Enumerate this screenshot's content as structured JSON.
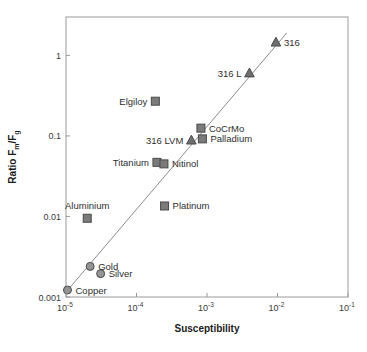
{
  "chart_data": {
    "type": "scatter",
    "title": "",
    "xlabel": "Susceptibility",
    "ylabel": "Ratio Fm/Fg",
    "ylabel_parts": {
      "prefix": "Ratio F",
      "sub1": "m",
      "mid": "/F",
      "sub2": "g"
    },
    "xscale": "log",
    "yscale": "log",
    "xlim": [
      1e-05,
      0.1
    ],
    "ylim": [
      0.001,
      3
    ],
    "grid": false,
    "legend": "none",
    "xticks": [
      {
        "value": 1e-05,
        "label": "10",
        "exponent": "-5"
      },
      {
        "value": 0.0001,
        "label": "10",
        "exponent": "-4"
      },
      {
        "value": 0.001,
        "label": "10",
        "exponent": "-3"
      },
      {
        "value": 0.01,
        "label": "10",
        "exponent": "-2"
      },
      {
        "value": 0.1,
        "label": "10",
        "exponent": "-1"
      }
    ],
    "yticks": [
      {
        "value": 1,
        "label": "1"
      },
      {
        "value": 0.1,
        "label": "0.1"
      },
      {
        "value": 0.01,
        "label": "0.01"
      },
      {
        "value": 0.001,
        "label": "0.001"
      }
    ],
    "trendline": {
      "x": [
        1e-05,
        0.0135
      ],
      "y": [
        0.00115,
        1.9
      ],
      "color": "#8c8c8c"
    },
    "marker_colors": {
      "square": "#7b7b7b",
      "circle": "#949494",
      "triangle": "#6e6e6e",
      "edge": "#4a4a4a"
    },
    "points": [
      {
        "name": "316",
        "x": 0.0095,
        "y": 1.45,
        "marker": "triangle",
        "label": "316",
        "label_pos": "right"
      },
      {
        "name": "316 L",
        "x": 0.004,
        "y": 0.6,
        "marker": "triangle",
        "label": "316 L",
        "label_pos": "left"
      },
      {
        "name": "Elgiloy",
        "x": 0.000185,
        "y": 0.27,
        "marker": "square",
        "label": "Elgiloy",
        "label_pos": "left"
      },
      {
        "name": "CoCrMo",
        "x": 0.00082,
        "y": 0.125,
        "marker": "square",
        "label": "CoCrMo",
        "label_pos": "right"
      },
      {
        "name": "Palladium",
        "x": 0.00086,
        "y": 0.092,
        "marker": "square",
        "label": "Palladium",
        "label_pos": "right"
      },
      {
        "name": "316 LVM",
        "x": 0.0006,
        "y": 0.088,
        "marker": "triangle",
        "label": "316 LVM",
        "label_pos": "left"
      },
      {
        "name": "Titanium",
        "x": 0.000195,
        "y": 0.047,
        "marker": "square",
        "label": "Titanium",
        "label_pos": "left"
      },
      {
        "name": "Nitinol",
        "x": 0.000245,
        "y": 0.045,
        "marker": "square",
        "label": "Nitinol",
        "label_pos": "right"
      },
      {
        "name": "Platinum",
        "x": 0.00025,
        "y": 0.0135,
        "marker": "square",
        "label": "Platinum",
        "label_pos": "right"
      },
      {
        "name": "Aluminium",
        "x": 2e-05,
        "y": 0.0095,
        "marker": "square",
        "label": "Aluminium",
        "label_pos": "above"
      },
      {
        "name": "Gold",
        "x": 2.2e-05,
        "y": 0.0024,
        "marker": "circle",
        "label": "Gold",
        "label_pos": "right"
      },
      {
        "name": "Silver",
        "x": 3.1e-05,
        "y": 0.00195,
        "marker": "circle",
        "label": "Silver",
        "label_pos": "right"
      },
      {
        "name": "Copper",
        "x": 1.05e-05,
        "y": 0.00122,
        "marker": "circle",
        "label": "Copper",
        "label_pos": "right"
      }
    ]
  }
}
